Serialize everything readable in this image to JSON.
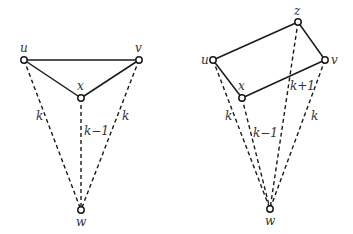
{
  "diagrams": [
    {
      "name": "left",
      "nodes": {
        "u": {
          "label": "u",
          "x": 24,
          "y": 60,
          "lx": 20,
          "ly": 52
        },
        "v": {
          "label": "v",
          "x": 139,
          "y": 60,
          "lx": 135,
          "ly": 52
        },
        "x": {
          "label": "x",
          "x": 81,
          "y": 98,
          "lx": 77,
          "ly": 90
        },
        "w": {
          "label": "w",
          "x": 81,
          "y": 210,
          "lx": 76,
          "ly": 226
        }
      },
      "solid_edges": [
        [
          "u",
          "v"
        ],
        [
          "u",
          "x"
        ],
        [
          "x",
          "v"
        ]
      ],
      "dashed_edges": [
        {
          "from": "u",
          "to": "w",
          "label": "k",
          "lx": 36,
          "ly": 120
        },
        {
          "from": "x",
          "to": "w",
          "label": "k−1",
          "lx": 84,
          "ly": 135
        },
        {
          "from": "v",
          "to": "w",
          "label": "k",
          "lx": 122,
          "ly": 120
        }
      ]
    },
    {
      "name": "right",
      "nodes": {
        "u": {
          "label": "u",
          "x": 213,
          "y": 60,
          "lx": 201,
          "ly": 64
        },
        "z": {
          "label": "z",
          "x": 298,
          "y": 22,
          "lx": 294,
          "ly": 15
        },
        "v": {
          "label": "v",
          "x": 325,
          "y": 60,
          "lx": 331,
          "ly": 64
        },
        "x": {
          "label": "x",
          "x": 242,
          "y": 98,
          "lx": 238,
          "ly": 90
        },
        "w": {
          "label": "w",
          "x": 270,
          "y": 209,
          "lx": 265,
          "ly": 225
        }
      },
      "solid_edges": [
        [
          "u",
          "z"
        ],
        [
          "z",
          "v"
        ],
        [
          "v",
          "x"
        ],
        [
          "x",
          "u"
        ]
      ],
      "dashed_edges": [
        {
          "from": "u",
          "to": "w",
          "label": "k",
          "lx": 225,
          "ly": 120
        },
        {
          "from": "x",
          "to": "w",
          "label": "k−1",
          "lx": 253,
          "ly": 137
        },
        {
          "from": "z",
          "to": "w",
          "label": "k+1",
          "lx": 290,
          "ly": 90
        },
        {
          "from": "v",
          "to": "w",
          "label": "k",
          "lx": 311,
          "ly": 120
        }
      ]
    }
  ]
}
